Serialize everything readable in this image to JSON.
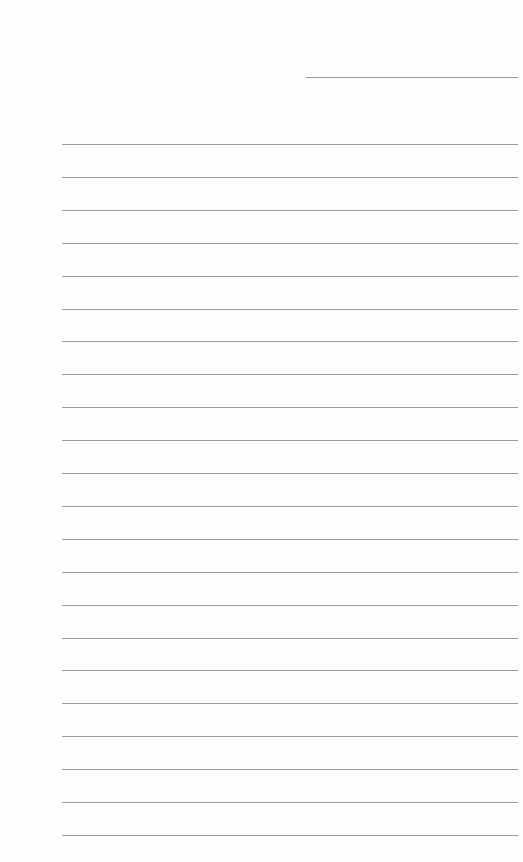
{
  "document": {
    "type": "lined-paper",
    "header_line": {
      "x": 306,
      "y": 77,
      "width": 212
    },
    "rules": {
      "count": 22,
      "start_y": 144,
      "spacing": 32.9,
      "left": 62,
      "width": 456
    },
    "line_color": "#9c9c9c",
    "background": "#ffffff"
  }
}
